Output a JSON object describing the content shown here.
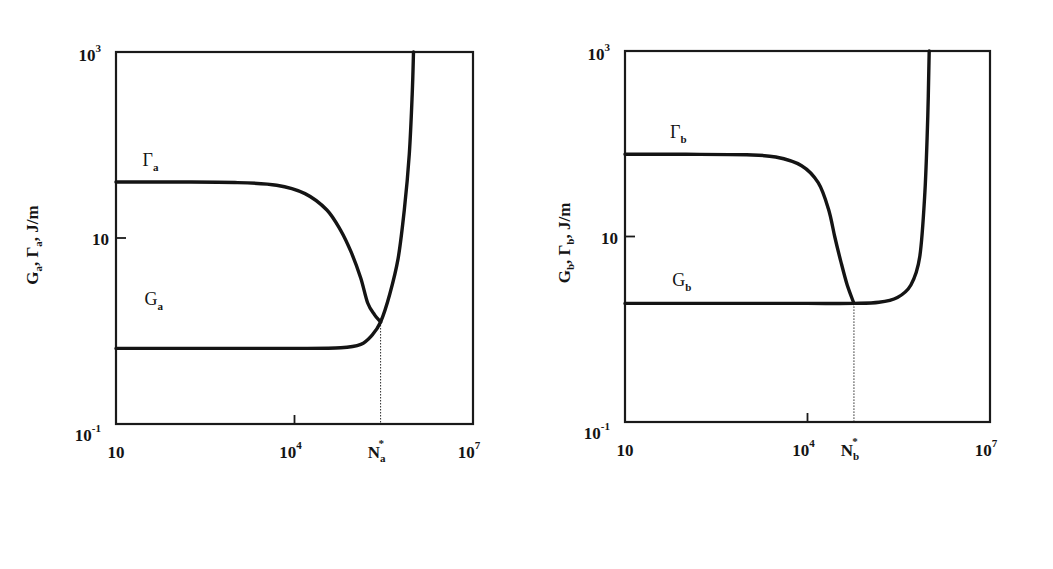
{
  "chart_data": [
    {
      "type": "line",
      "panel_label": "a)",
      "xscale": "log",
      "yscale": "log",
      "xlim": [
        10,
        10000000
      ],
      "ylim": [
        0.1,
        1000
      ],
      "xlabel": "N, cycles",
      "ylabel": "G_a, Γ_a, J/m",
      "ylabel_parts": {
        "g": "G",
        "g_sub": "a",
        "gamma": "Γ",
        "gamma_sub": "a",
        "unit": ", J/m"
      },
      "x_ticks": [
        {
          "value": 10,
          "label": "10",
          "sup": ""
        },
        {
          "value": 10000,
          "label": "10",
          "sup": "4"
        },
        {
          "value": 10000000,
          "label": "10",
          "sup": "7"
        }
      ],
      "y_ticks": [
        {
          "value": 1000,
          "label": "10",
          "sup": "3"
        },
        {
          "value": 10,
          "label": "10",
          "sup": ""
        },
        {
          "value": 0.1,
          "label": "10",
          "sup": "-1"
        }
      ],
      "critical_point": {
        "label": "N",
        "sup": "*",
        "sub": "a",
        "x": 280000,
        "y": 1.25
      },
      "grid": false,
      "legend": "none (inline curve labels)",
      "series": [
        {
          "name": "Γ_a",
          "label_main": "Γ",
          "label_sub": "a",
          "label_at": [
            28,
            60
          ],
          "x": [
            10,
            100,
            1000,
            5000,
            15000,
            35000,
            60000,
            90000,
            130000,
            170000,
            220000,
            280000
          ],
          "y": [
            40,
            40,
            39.5,
            37,
            30,
            20,
            12,
            7,
            3.7,
            2.0,
            1.5,
            1.25
          ]
        },
        {
          "name": "G_a",
          "label_main": "G",
          "label_sub": "a",
          "label_at": [
            30,
            1.9
          ],
          "x": [
            10,
            100,
            1000,
            10000,
            60000,
            130000,
            200000,
            280000,
            400000,
            550000,
            700000,
            850000,
            950000,
            1000000
          ],
          "y": [
            0.65,
            0.65,
            0.65,
            0.65,
            0.66,
            0.72,
            0.9,
            1.25,
            2.5,
            6,
            20,
            80,
            350,
            1000
          ]
        }
      ]
    },
    {
      "type": "line",
      "panel_label": "b)",
      "xscale": "log",
      "yscale": "log",
      "xlim": [
        10,
        10000000
      ],
      "ylim": [
        0.1,
        1000
      ],
      "xlabel": "N, cycles",
      "ylabel": "G_b, Γ_b, J/m",
      "ylabel_parts": {
        "g": "G",
        "g_sub": "b",
        "gamma": "Γ",
        "gamma_sub": "b",
        "unit": ", J/m"
      },
      "x_ticks": [
        {
          "value": 10,
          "label": "10",
          "sup": ""
        },
        {
          "value": 10000,
          "label": "10",
          "sup": "4"
        },
        {
          "value": 10000000,
          "label": "10",
          "sup": "7"
        }
      ],
      "y_ticks": [
        {
          "value": 1000,
          "label": "10",
          "sup": "3"
        },
        {
          "value": 10,
          "label": "10",
          "sup": ""
        },
        {
          "value": 0.1,
          "label": "10",
          "sup": "-1"
        }
      ],
      "critical_point": {
        "label": "N",
        "sup": "*",
        "sub": "b",
        "x": 58000,
        "y": 1.9
      },
      "grid": false,
      "legend": "none (inline curve labels)",
      "series": [
        {
          "name": "Γ_b",
          "label_main": "Γ",
          "label_sub": "b",
          "label_at": [
            55,
            115
          ],
          "x": [
            10,
            100,
            1000,
            3000,
            8000,
            15000,
            22000,
            28000,
            35000,
            45000,
            58000
          ],
          "y": [
            77,
            77,
            76,
            72,
            58,
            38,
            20,
            10,
            5.5,
            3.0,
            1.9
          ]
        },
        {
          "name": "G_b",
          "label_main": "G",
          "label_sub": "b",
          "label_at": [
            60,
            2.9
          ],
          "x": [
            10,
            100,
            1000,
            10000,
            58000,
            150000,
            300000,
            500000,
            700000,
            850000,
            950000,
            1000000
          ],
          "y": [
            1.9,
            1.9,
            1.9,
            1.9,
            1.9,
            1.95,
            2.2,
            3.0,
            6,
            30,
            200,
            1000
          ]
        }
      ]
    }
  ]
}
